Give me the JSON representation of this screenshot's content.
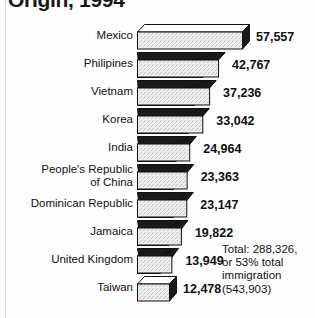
{
  "chart_data": {
    "type": "bar",
    "orientation": "horizontal",
    "title": "Origin, 1994",
    "xlabel": "",
    "ylabel": "",
    "categories": [
      "Mexico",
      "Philipines",
      "Vietnam",
      "Korea",
      "India",
      "People's Republic\nof China",
      "Dominican Republic",
      "Jamaica",
      "United Kingdom",
      "Taiwan"
    ],
    "values": [
      57557,
      42767,
      37236,
      33042,
      24964,
      23363,
      23147,
      19822,
      13949,
      12478
    ],
    "value_labels": [
      "57,557",
      "42,767",
      "37,236",
      "33,042",
      "24,964",
      "23,363",
      "23,147",
      "19,822",
      "13,949",
      "12,478"
    ],
    "annotation": "Total: 288,326,\nor 53% total\nimmigration\n(543,903)",
    "xlim": [
      0,
      57557
    ],
    "grid": false,
    "legend": false,
    "style": "3d-shaded-bars",
    "colors": {
      "bar_fill": "#ededed",
      "bar_side": "#1a1a1a",
      "bar_outline": "#111111",
      "background": "#fdfdfd",
      "text": "#121212"
    }
  }
}
